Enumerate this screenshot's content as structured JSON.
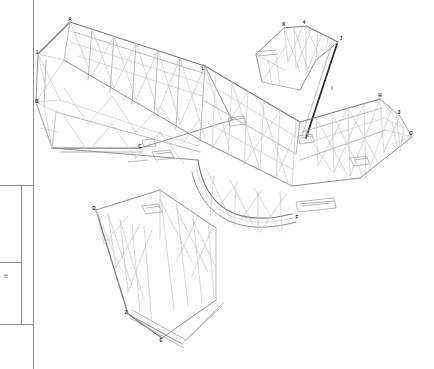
{
  "document": {
    "kind": "engineering-isometric-wireframe",
    "subject": "steel space frame truss assembly",
    "background_color": "#ffffff",
    "line_color_light": "#c2c2c2",
    "line_color_mid": "#a8a8a8",
    "line_color_dark": "#8a8a8a",
    "accent_dark_member_color": "#2b2b2b"
  },
  "title_block": {
    "visible": true,
    "edge": "left",
    "partial_text": "e",
    "frame_color": "#8c8c8c"
  },
  "node_labels": [
    {
      "id": "A",
      "text": "A",
      "x": 70,
      "y": 19
    },
    {
      "id": "1",
      "text": "1",
      "x": 37,
      "y": 52
    },
    {
      "id": "B",
      "text": "B",
      "x": 37,
      "y": 101
    },
    {
      "id": "C",
      "text": "C",
      "x": 140,
      "y": 146
    },
    {
      "id": "D",
      "text": "D",
      "x": 94,
      "y": 208
    },
    {
      "id": "2",
      "text": "2",
      "x": 126,
      "y": 312
    },
    {
      "id": "E",
      "text": "E",
      "x": 161,
      "y": 340
    },
    {
      "id": "F",
      "text": "F",
      "x": 297,
      "y": 217
    },
    {
      "id": "G",
      "text": "G",
      "x": 411,
      "y": 133
    },
    {
      "id": "3",
      "text": "3",
      "x": 399,
      "y": 112
    },
    {
      "id": "H",
      "text": "H",
      "x": 380,
      "y": 95
    },
    {
      "id": "I",
      "text": "I",
      "x": 332,
      "y": 88
    },
    {
      "id": "J",
      "text": "J",
      "x": 341,
      "y": 38
    },
    {
      "id": "4",
      "text": "4",
      "x": 304,
      "y": 22
    },
    {
      "id": "K",
      "text": "K",
      "x": 284,
      "y": 24
    },
    {
      "id": "L",
      "text": "L",
      "x": 203,
      "y": 68
    }
  ]
}
